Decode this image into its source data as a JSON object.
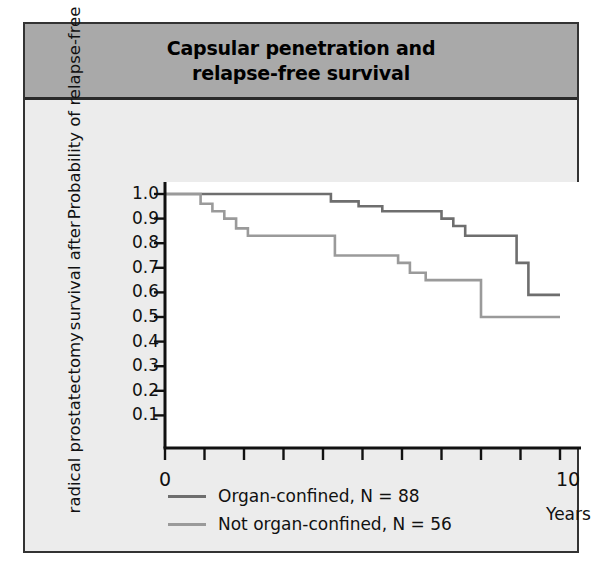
{
  "figure": {
    "title_lines": [
      "Capsular penetration and",
      "relapse-free survival"
    ],
    "header_bg": "#a9a9a9",
    "body_bg": "#ececec",
    "border_color": "#333333"
  },
  "chart_data": {
    "type": "line",
    "subtype": "kaplan-meier-step",
    "title": "Capsular penetration and relapse-free survival",
    "xlabel": "Years",
    "ylabel": "Probability of relapse-free survival after radical prostatectomy",
    "ylabel_lines": [
      "Probability of relapse-free",
      "survival after",
      "radical prostatectomy"
    ],
    "xlim": [
      0,
      10
    ],
    "ylim": [
      0,
      1.0
    ],
    "xticks": [
      0,
      1,
      2,
      3,
      4,
      5,
      6,
      7,
      8,
      9,
      10
    ],
    "xtick_labels": [
      "0",
      "",
      "",
      "",
      "",
      "",
      "",
      "",
      "",
      "",
      "10"
    ],
    "yticks": [
      1.0,
      0.9,
      0.8,
      0.7,
      0.6,
      0.5,
      0.4,
      0.3,
      0.2,
      0.1
    ],
    "ytick_labels": [
      "1.0",
      "0.9",
      "0.8",
      "0.7",
      "0.6",
      "0.5",
      "0.4",
      "0.3",
      "0.2",
      "0.1"
    ],
    "grid": false,
    "legend_position": "below-axes-left",
    "series": [
      {
        "name": "Organ-confined, N = 88",
        "color": "#6e6e6e",
        "n": 88,
        "steps": [
          [
            0.0,
            1.0
          ],
          [
            4.2,
            1.0
          ],
          [
            4.2,
            0.97
          ],
          [
            4.9,
            0.97
          ],
          [
            4.9,
            0.95
          ],
          [
            5.5,
            0.95
          ],
          [
            5.5,
            0.93
          ],
          [
            7.0,
            0.93
          ],
          [
            7.0,
            0.9
          ],
          [
            7.3,
            0.9
          ],
          [
            7.3,
            0.87
          ],
          [
            7.6,
            0.87
          ],
          [
            7.6,
            0.83
          ],
          [
            8.9,
            0.83
          ],
          [
            8.9,
            0.72
          ],
          [
            9.2,
            0.72
          ],
          [
            9.2,
            0.59
          ],
          [
            10.0,
            0.59
          ]
        ]
      },
      {
        "name": "Not organ-confined, N = 56",
        "color": "#9a9a9a",
        "n": 56,
        "steps": [
          [
            0.0,
            1.0
          ],
          [
            0.9,
            1.0
          ],
          [
            0.9,
            0.96
          ],
          [
            1.2,
            0.96
          ],
          [
            1.2,
            0.93
          ],
          [
            1.5,
            0.93
          ],
          [
            1.5,
            0.9
          ],
          [
            1.8,
            0.9
          ],
          [
            1.8,
            0.86
          ],
          [
            2.1,
            0.86
          ],
          [
            2.1,
            0.83
          ],
          [
            4.3,
            0.83
          ],
          [
            4.3,
            0.75
          ],
          [
            5.9,
            0.75
          ],
          [
            5.9,
            0.72
          ],
          [
            6.2,
            0.72
          ],
          [
            6.2,
            0.68
          ],
          [
            6.6,
            0.68
          ],
          [
            6.6,
            0.65
          ],
          [
            8.0,
            0.65
          ],
          [
            8.0,
            0.5
          ],
          [
            10.0,
            0.5
          ]
        ]
      }
    ]
  },
  "legend": {
    "rows": [
      {
        "label": "Organ-confined, N = 88",
        "color": "#6e6e6e"
      },
      {
        "label": "Not organ-confined, N = 56",
        "color": "#9a9a9a"
      }
    ]
  },
  "axis": {
    "x_title": "Years",
    "x_min_label": "0",
    "x_max_label": "10"
  }
}
